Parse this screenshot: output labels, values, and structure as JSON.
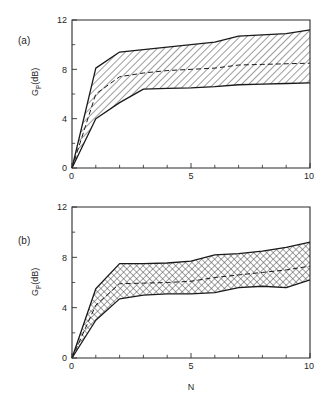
{
  "figure": {
    "background": "#ffffff",
    "ink_color": "#1a1a1a",
    "xlabel": "N",
    "ylabel_main": "G",
    "ylabel_sub": "P",
    "ylabel_unit": "(dB)"
  },
  "panels": [
    {
      "id": "a",
      "label": "(a)"
    },
    {
      "id": "b",
      "label": "(b)"
    }
  ],
  "axis": {
    "x_ticklabels": [
      "0",
      "5",
      "10"
    ],
    "x_tickvalues": [
      0,
      5,
      10
    ],
    "y_ticklabels": [
      "0",
      "4",
      "8",
      "12"
    ],
    "y_tickvalues": [
      0,
      4,
      8,
      12
    ]
  },
  "chart_data": [
    {
      "type": "area",
      "panel": "a",
      "title": "(a)",
      "xlabel": "",
      "ylabel": "G_P (dB)",
      "xlim": [
        0,
        10
      ],
      "ylim": [
        0,
        12
      ],
      "xticks": [
        0,
        5,
        10
      ],
      "yticks": [
        0,
        4,
        8,
        12
      ],
      "x_minor_tick_step": 1,
      "y_minor_tick_step": 2,
      "grid": false,
      "legend": "none",
      "hatch": "diagonal",
      "x": [
        0,
        1,
        2,
        3,
        4,
        5,
        6,
        7,
        8,
        9,
        10
      ],
      "series": [
        {
          "name": "upper bound",
          "style": "solid",
          "values": [
            0.0,
            8.1,
            9.4,
            9.6,
            9.8,
            10.0,
            10.2,
            10.7,
            10.8,
            10.9,
            11.2
          ]
        },
        {
          "name": "mean",
          "style": "dashed",
          "values": [
            0.0,
            6.0,
            7.4,
            7.7,
            7.9,
            8.0,
            8.1,
            8.35,
            8.4,
            8.45,
            8.5
          ]
        },
        {
          "name": "lower bound",
          "style": "solid",
          "values": [
            0.0,
            4.0,
            5.3,
            6.4,
            6.45,
            6.5,
            6.6,
            6.75,
            6.8,
            6.85,
            6.9
          ]
        }
      ]
    },
    {
      "type": "area",
      "panel": "b",
      "title": "(b)",
      "xlabel": "N",
      "ylabel": "G_P (dB)",
      "xlim": [
        0,
        10
      ],
      "ylim": [
        0,
        12
      ],
      "xticks": [
        0,
        5,
        10
      ],
      "yticks": [
        0,
        4,
        8,
        12
      ],
      "x_minor_tick_step": 1,
      "y_minor_tick_step": 2,
      "grid": false,
      "legend": "none",
      "hatch": "cross",
      "x": [
        0,
        1,
        2,
        3,
        4,
        5,
        6,
        7,
        8,
        9,
        10
      ],
      "series": [
        {
          "name": "upper bound",
          "style": "solid",
          "values": [
            0.0,
            5.5,
            7.5,
            7.5,
            7.55,
            7.7,
            8.2,
            8.3,
            8.5,
            8.8,
            9.2
          ]
        },
        {
          "name": "mean",
          "style": "dashed",
          "values": [
            0.0,
            4.2,
            5.9,
            5.95,
            6.0,
            6.1,
            6.4,
            6.6,
            6.8,
            7.0,
            7.3
          ]
        },
        {
          "name": "lower bound",
          "style": "solid",
          "values": [
            0.0,
            3.0,
            4.7,
            5.0,
            5.1,
            5.1,
            5.2,
            5.6,
            5.7,
            5.6,
            6.2
          ]
        }
      ]
    }
  ]
}
